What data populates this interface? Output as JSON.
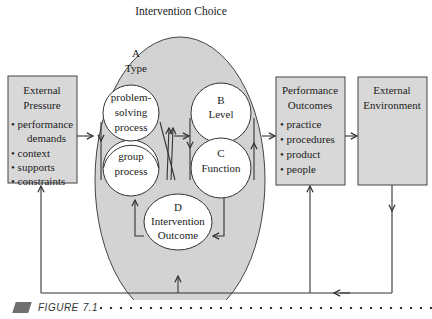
{
  "diagram": {
    "title": "Intervention Choice",
    "colors": {
      "box_fill": "#d8d8d8",
      "ellipse_fill": "#d3d3d3",
      "circle_fill": "#ffffff",
      "stroke": "#333333"
    },
    "external_pressure": {
      "title_line1": "External",
      "title_line2": "Pressure",
      "items": [
        "performance",
        "demands",
        "context",
        "supports",
        "constraints"
      ]
    },
    "intervention": {
      "type_label_letter": "A",
      "type_label": "Type",
      "problem_solving": [
        "problem-",
        "solving",
        "process"
      ],
      "group": [
        "group",
        "process"
      ],
      "level_letter": "B",
      "level": "Level",
      "function_letter": "C",
      "function": "Function",
      "outcome_letter": "D",
      "outcome_line1": "Intervention",
      "outcome_line2": "Outcome"
    },
    "performance_outcomes": {
      "title_line1": "Performance",
      "title_line2": "Outcomes",
      "items": [
        "practice",
        "procedures",
        "product",
        "people"
      ]
    },
    "external_environment": {
      "title_line1": "External",
      "title_line2": "Environment"
    }
  },
  "caption": {
    "label": "Figure",
    "number": "7.1"
  }
}
